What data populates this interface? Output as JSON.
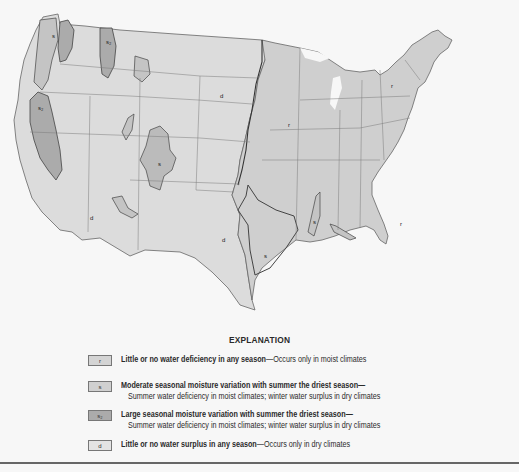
{
  "map": {
    "region_labels": [
      {
        "code": "r",
        "x": 391,
        "y": 88,
        "zone": "northeast"
      },
      {
        "code": "r",
        "x": 288,
        "y": 127,
        "zone": "upper-midwest"
      },
      {
        "code": "r",
        "x": 400,
        "y": 226,
        "zone": "southeast"
      },
      {
        "code": "s",
        "x": 264,
        "y": 258,
        "zone": "east-texas"
      },
      {
        "code": "s",
        "x": 313,
        "y": 224,
        "zone": "mississippi-valley"
      },
      {
        "code": "d",
        "x": 220,
        "y": 98,
        "zone": "great-plains"
      },
      {
        "code": "d",
        "x": 90,
        "y": 220,
        "zone": "great-basin"
      },
      {
        "code": "d",
        "x": 222,
        "y": 242,
        "zone": "texas"
      },
      {
        "code": "s2",
        "x": 38,
        "y": 110,
        "zone": "california-valley"
      },
      {
        "code": "s2",
        "x": 108,
        "y": 42,
        "zone": "idaho"
      },
      {
        "code": "s",
        "x": 52,
        "y": 38,
        "zone": "washington-cascades"
      },
      {
        "code": "s",
        "x": 160,
        "y": 170,
        "zone": "colorado-rockies"
      }
    ],
    "fill_colors": {
      "d": "#dcdcdc",
      "r": "#cdcdcd",
      "s": "#c8c8c8",
      "s2": "#ababab",
      "water": "#f7f7f7",
      "border": "#5a5a5a"
    }
  },
  "legend": {
    "title": "EXPLANATION",
    "items": [
      {
        "code": "r",
        "label_bold": "Little or no water deficiency in any season",
        "label_rest": "—Occurs only in moist climates",
        "sub": ""
      },
      {
        "code": "s",
        "label_bold": "Moderate seasonal moisture variation with summer the driest season—",
        "label_rest": "",
        "sub": "Summer water deficiency in moist climates; winter water surplus in dry climates"
      },
      {
        "code": "s₂",
        "label_bold": "Large seasonal moisture variation with summer the driest season—",
        "label_rest": "",
        "sub": "Summer water deficiency in moist climates; winter water surplus in dry climates"
      },
      {
        "code": "d",
        "label_bold": "Little or no water surplus in any season",
        "label_rest": "—Occurs only in dry climates",
        "sub": ""
      }
    ]
  }
}
